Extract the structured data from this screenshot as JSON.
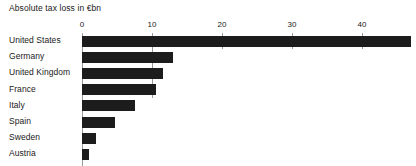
{
  "chart_data": {
    "type": "bar",
    "orientation": "horizontal",
    "title": "Absolute tax loss in €bn",
    "xlabel": "",
    "ylabel": "",
    "categories": [
      "United States",
      "Germany",
      "United Kingdom",
      "France",
      "Italy",
      "Spain",
      "Sweden",
      "Austria"
    ],
    "values": [
      47,
      13,
      11.5,
      10.5,
      7.5,
      4.7,
      2,
      1
    ],
    "xlim": [
      0,
      47.5
    ],
    "ticks": [
      0,
      10,
      20,
      30,
      40
    ],
    "tick_labels": [
      "0",
      "10",
      "20",
      "30",
      "40"
    ],
    "grid": true,
    "grid_axis": "x",
    "legend": null,
    "bar_color": "#1c1c1c",
    "grid_color": "#9a9a9a",
    "background_color": "#ffffff"
  }
}
